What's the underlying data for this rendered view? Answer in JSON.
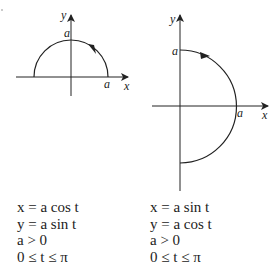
{
  "left_figure": {
    "axis_x_label": "x",
    "axis_y_label": "y",
    "top_label": "a",
    "right_label": "a",
    "curve": "upper semicircle, counterclockwise arrow"
  },
  "right_figure": {
    "axis_x_label": "x",
    "axis_y_label": "y",
    "top_label": "a",
    "right_label": "a",
    "curve": "right semicircle, clockwise arrow"
  },
  "left_equations": [
    "x = a cos t",
    "y = a sin t",
    "a > 0",
    "0 ≤ t ≤ π"
  ],
  "right_equations": [
    "x = a sin t",
    "y = a cos t",
    "a > 0",
    "0 ≤ t ≤ π"
  ]
}
